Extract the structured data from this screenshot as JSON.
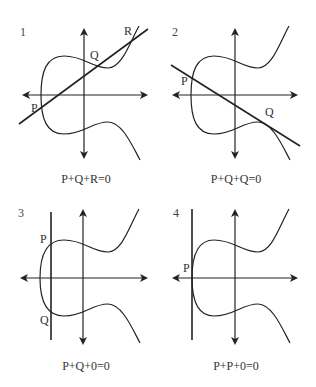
{
  "figure": {
    "panels": [
      {
        "number": "1",
        "caption": "P+Q+R=0",
        "points": [
          "P",
          "Q",
          "R"
        ],
        "line": "secant line through P, Q, R"
      },
      {
        "number": "2",
        "caption": "P+Q+Q=0",
        "points": [
          "P",
          "Q"
        ],
        "line": "line through P tangent at Q"
      },
      {
        "number": "3",
        "caption": "P+Q+0=0",
        "points": [
          "P",
          "Q"
        ],
        "line": "vertical line through P and Q"
      },
      {
        "number": "4",
        "caption": "P+P+0=0",
        "points": [
          "P"
        ],
        "line": "vertical tangent at P"
      }
    ]
  },
  "colors": {
    "stroke": "#222222",
    "background": "#ffffff"
  }
}
